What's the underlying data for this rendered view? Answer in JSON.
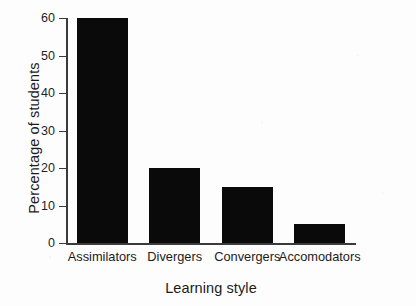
{
  "chart_data": {
    "type": "bar",
    "title": "",
    "xlabel": "Learning style",
    "ylabel": "Percentage of students",
    "categories": [
      "Assimilators",
      "Divergers",
      "Convergers",
      "Accomodators"
    ],
    "values": [
      60,
      20,
      15,
      5
    ],
    "ylim": [
      0,
      60
    ],
    "yticks": [
      0,
      10,
      20,
      30,
      40,
      50,
      60
    ],
    "ytick_labels": [
      "0",
      "10",
      "20",
      "30",
      "40",
      "50",
      "60"
    ],
    "grid": false,
    "legend": "none",
    "bar_color": "#0a0a0a",
    "axis_color": "#3b3b3b",
    "background_color": "#fdfdfd"
  }
}
